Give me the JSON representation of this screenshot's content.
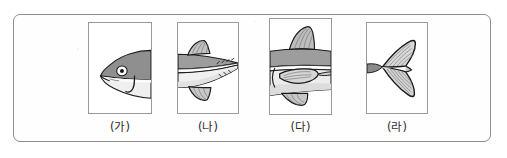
{
  "figure": {
    "type": "fish-body-parts-panel-figure",
    "border_color": "#8d8d8d",
    "background_color": "#ffffff",
    "panel_border_color": "#9a9a9a",
    "panels": [
      {
        "id": "ga",
        "caption": "(가)",
        "content_name": "fish-head-illustration",
        "description": "머리",
        "parts_shown": [
          "eye",
          "mouth",
          "gill-cover"
        ]
      },
      {
        "id": "na",
        "caption": "(나)",
        "content_name": "fish-tail-section-illustration",
        "description": "꼬리자루",
        "parts_shown": [
          "dorsal-fin",
          "anal-fin",
          "caudal-peduncle"
        ]
      },
      {
        "id": "da",
        "caption": "(다)",
        "content_name": "fish-midbody-illustration",
        "description": "몸통",
        "parts_shown": [
          "dorsal-fin",
          "pectoral-fin",
          "pelvic-fin"
        ]
      },
      {
        "id": "ra",
        "caption": "(라)",
        "content_name": "fish-caudal-fin-illustration",
        "description": "꼬리지느러미",
        "parts_shown": [
          "caudal-fin"
        ]
      }
    ]
  },
  "colors": {
    "fish_dorsal_gray": "#9d9d9d",
    "fish_belly_light": "#f2f2f2",
    "outline": "#1a1a1a",
    "fin_gray": "#b9b9b9",
    "caption_text": "#2c2c2c"
  }
}
